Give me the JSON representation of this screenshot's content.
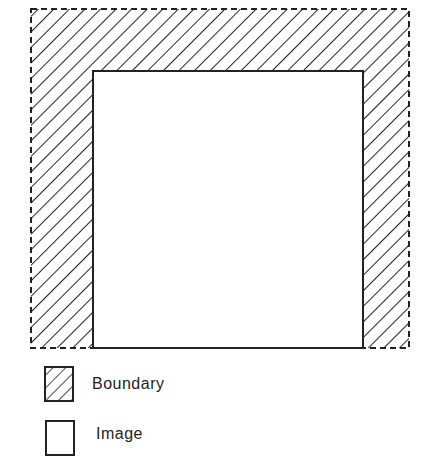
{
  "diagram": {
    "outer_region": {
      "name": "boundary",
      "x": 31,
      "y": 9,
      "width": 378,
      "height": 339,
      "border": "dashed"
    },
    "inner_region": {
      "name": "image",
      "x": 93,
      "y": 71,
      "width": 270,
      "height": 277,
      "border": "solid"
    },
    "hatch": "diagonal"
  },
  "legend": {
    "items": [
      {
        "label": "Boundary",
        "swatch": "hatched"
      },
      {
        "label": "Image",
        "swatch": "empty"
      }
    ]
  },
  "colors": {
    "line": "#222222",
    "background": "#ffffff"
  }
}
